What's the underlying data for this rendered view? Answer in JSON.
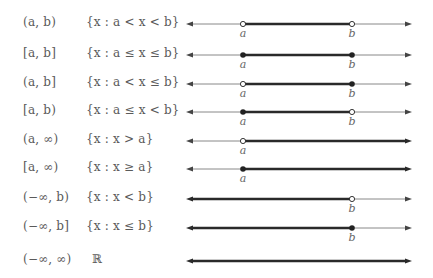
{
  "colors": {
    "text": "#5a5a5a",
    "thin_line": "#888888",
    "thick_line": "#2a2a2a",
    "point": "#222222"
  },
  "axis": {
    "x_left": 186,
    "x_right": 412,
    "a_x": 243,
    "b_x": 352
  },
  "rows": [
    {
      "notation": "(a, b)",
      "set": "{x : a < x < b}",
      "y": 24,
      "segment": "a-b",
      "a": "open",
      "b": "open",
      "labels": [
        "a",
        "b"
      ]
    },
    {
      "notation": "[a, b]",
      "set": "{x : a ≤ x ≤ b}",
      "y": 55,
      "segment": "a-b",
      "a": "closed",
      "b": "closed",
      "labels": [
        "a",
        "b"
      ]
    },
    {
      "notation": "(a, b]",
      "set": "{x : a < x ≤ b}",
      "y": 84,
      "segment": "a-b",
      "a": "open",
      "b": "closed",
      "labels": [
        "a",
        "b"
      ]
    },
    {
      "notation": "[a, b)",
      "set": "{x : a ≤ x < b}",
      "y": 112,
      "segment": "a-b",
      "a": "closed",
      "b": "open",
      "labels": [
        "a",
        "b"
      ]
    },
    {
      "notation": "(a, ∞)",
      "set": "{x : x > a}",
      "y": 141,
      "segment": "a-inf",
      "a": "open",
      "b": null,
      "labels": [
        "a"
      ]
    },
    {
      "notation": "[a, ∞)",
      "set": "{x : x ≥ a}",
      "y": 169,
      "segment": "a-inf",
      "a": "closed",
      "b": null,
      "labels": [
        "a"
      ]
    },
    {
      "notation": "(−∞, b)",
      "set": "{x : x < b}",
      "y": 199,
      "segment": "inf-b",
      "a": null,
      "b": "open",
      "labels": [
        "b"
      ]
    },
    {
      "notation": "(−∞, b]",
      "set": "{x : x ≤ b}",
      "y": 228,
      "segment": "inf-b",
      "a": null,
      "b": "closed",
      "labels": [
        "b"
      ]
    },
    {
      "notation": "(−∞, ∞)",
      "set": "ℝ",
      "y": 261,
      "segment": "all",
      "a": null,
      "b": null,
      "labels": []
    }
  ]
}
